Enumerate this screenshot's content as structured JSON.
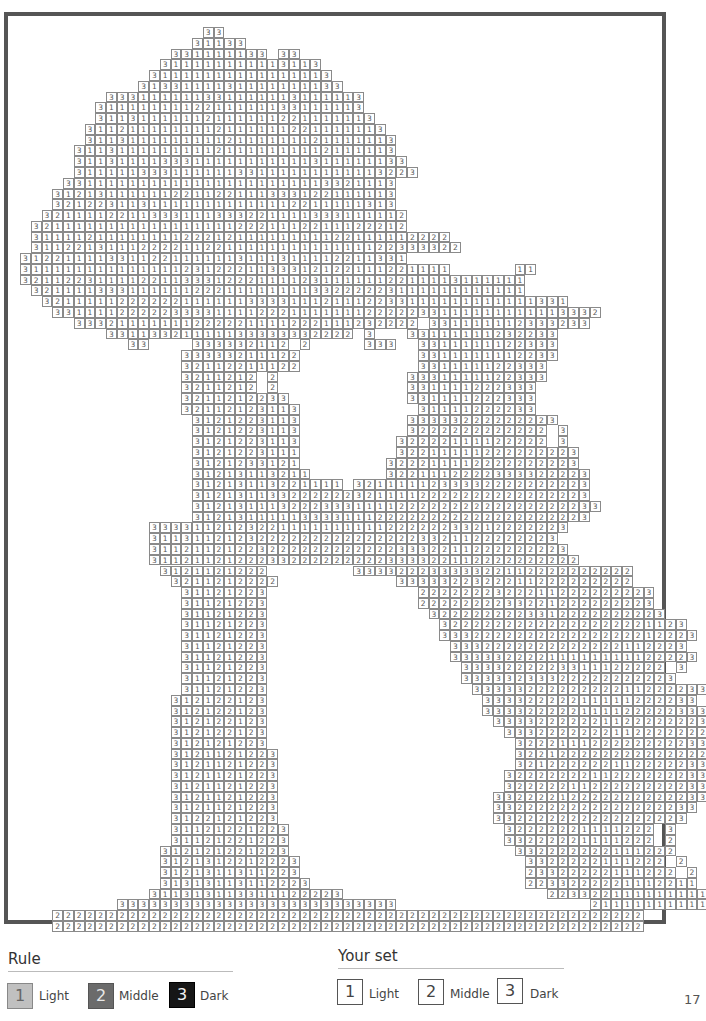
{
  "page_number": "17",
  "puzzle": {
    "cell_width": 10.75,
    "cell_height": 10.77,
    "origin_x": 20,
    "origin_y": 27,
    "rows": [
      {
        "start": 17,
        "cells": "33"
      },
      {
        "start": 16,
        "cells": "31133"
      },
      {
        "start": 14,
        "cells": "331111133 33"
      },
      {
        "start": 13,
        "cells": "311111111113113"
      },
      {
        "start": 12,
        "cells": "31111111111111113"
      },
      {
        "start": 11,
        "cells": "3133111131111111133"
      },
      {
        "start": 8,
        "cells": "333111111331111113111113"
      },
      {
        "start": 7,
        "cells": "3111111112211111133111113"
      },
      {
        "start": 7,
        "cells": "31131111112111111221111113"
      },
      {
        "start": 6,
        "cells": "3112111111112111111221111113"
      },
      {
        "start": 6,
        "cells": "31131111111112111111121111113"
      },
      {
        "start": 5,
        "cells": "311311111111121111111112111113"
      },
      {
        "start": 5,
        "cells": "3113111133311111111111311111133"
      },
      {
        "start": 5,
        "cells": "31111133311111133111111111113223"
      },
      {
        "start": 4,
        "cells": "3311111111111111111111113321113"
      },
      {
        "start": 3,
        "cells": "31213111111221122111333122111113"
      },
      {
        "start": 3,
        "cells": "32122311311111111111112211111313"
      },
      {
        "start": 2,
        "cells": "3211112211333111333221111333111112"
      },
      {
        "start": 1,
        "cells": "32111111111111111112221112211122212"
      },
      {
        "start": 1,
        "cells": "311112111111112221211111111122111112222"
      },
      {
        "start": 1,
        "cells": "3112213111222211221111111111111122333322"
      },
      {
        "start": 0,
        "cells": "312211113311221111113111311112211331"
      },
      {
        "start": 0,
        "cells": "3111111111111112312221133312122111221111      11"
      },
      {
        "start": 0,
        "cells": "32112231111221133312221111231111112211113111111"
      },
      {
        "start": 1,
        "cells": "3211113331111112221111111133222223111111111111"
      },
      {
        "start": 2,
        "cells": "3211111222222111111333311121112233111111111111331"
      },
      {
        "start": 3,
        "cells": "331111222223333111122211111112222233111111111113332"
      },
      {
        "start": 5,
        "cells": "33321111111222221111222111232222 331111112333233"
      },
      {
        "start": 8,
        "cells": "33113321111133333332222 3   33111111232233"
      },
      {
        "start": 10,
        "cells": "33    333332112 2     333  3311111122333"
      },
      {
        "start": 15,
        "cells": "33333211122           3311111112233"
      },
      {
        "start": 15,
        "cells": "32112211122           331111122333"
      },
      {
        "start": 15,
        "cells": "3211212 2            3331111122333"
      },
      {
        "start": 15,
        "cells": "3211212 2            331111222333"
      },
      {
        "start": 15,
        "cells": "3211212233           331111222333"
      },
      {
        "start": 15,
        "cells": "32112123113           31111222233"
      },
      {
        "start": 16,
        "cells": "3121223113          33333222222223"
      },
      {
        "start": 16,
        "cells": "3121223113          3222222222222 3"
      },
      {
        "start": 16,
        "cells": "3121223113         32222111122222 3"
      },
      {
        "start": 16,
        "cells": "3121223111         32211111222222223"
      },
      {
        "start": 16,
        "cells": "3121233121        322211112222222223"
      },
      {
        "start": 16,
        "cells": "31213113211       3221112222333322223"
      },
      {
        "start": 16,
        "cells": "31213113221111 3211111233332222222223"
      },
      {
        "start": 16,
        "cells": "3121311332222223211112222222222222223"
      },
      {
        "start": 16,
        "cells": "31213111322233311112222222222222222233"
      },
      {
        "start": 16,
        "cells": "3121311111333311122222222222222222223"
      },
      {
        "start": 12,
        "cells": "333311212322111111111122222233212222223"
      },
      {
        "start": 12,
        "cells": "31131121232222222222222223321122222223"
      },
      {
        "start": 12,
        "cells": "311211212232222222222223332211222222223"
      },
      {
        "start": 12,
        "cells": "3112112122233222222222333322112222222222"
      },
      {
        "start": 13,
        "cells": "3121121222        33332223333322112222222222"
      },
      {
        "start": 14,
        "cells": "3211212222           3333322322211222222222"
      },
      {
        "start": 15,
        "cells": "31121223              2222222322211222222223"
      },
      {
        "start": 15,
        "cells": "31121223              2222222233221222222223"
      },
      {
        "start": 15,
        "cells": "31121223               3222222223312222222223"
      },
      {
        "start": 15,
        "cells": "31121223                32222222222222222221123"
      },
      {
        "start": 15,
        "cells": "31121223                333222222222222222212223"
      },
      {
        "start": 15,
        "cells": "31121223                 3332222222222222112223"
      },
      {
        "start": 15,
        "cells": "31121223                 33333222211111111122223"
      },
      {
        "start": 15,
        "cells": "31121223                  3333222223311122222 3"
      },
      {
        "start": 15,
        "cells": "31121223                  33333233322222222223"
      },
      {
        "start": 15,
        "cells": "31121223                   3333322222222211222233"
      },
      {
        "start": 14,
        "cells": "312122123                    33332222211111222233"
      },
      {
        "start": 14,
        "cells": "312122123                    333322222111122222333"
      },
      {
        "start": 14,
        "cells": "312122123                     3333222222112222222333"
      },
      {
        "start": 14,
        "cells": "312122123                      3332222222112222222333"
      },
      {
        "start": 14,
        "cells": "312121223                       322211122222222233"
      },
      {
        "start": 14,
        "cells": "3121121223                      32212222222222222233"
      },
      {
        "start": 14,
        "cells": "3121121223                      3212222221122222333"
      },
      {
        "start": 14,
        "cells": "3121121223                     32222222112222222333"
      },
      {
        "start": 14,
        "cells": "3121121223                     3222221122222222233"
      },
      {
        "start": 14,
        "cells": "3121121223                    332222122222222222333"
      },
      {
        "start": 14,
        "cells": "3121121223                    3322222222222222233"
      },
      {
        "start": 14,
        "cells": "3122121223                    332222222222222223"
      },
      {
        "start": 14,
        "cells": "31121221223                    32222221111222 3"
      },
      {
        "start": 14,
        "cells": "31121221223                    33222221111222 2"
      },
      {
        "start": 13,
        "cells": "312121221223                     332222222111222"
      },
      {
        "start": 13,
        "cells": "3121312212223                     3322222111222 2"
      },
      {
        "start": 13,
        "cells": "3121311311223                     23322222111222 2"
      },
      {
        "start": 13,
        "cells": "31313113112223                    2233222221112211"
      },
      {
        "start": 12,
        "cells": "311313113311122223                   223322111111111"
      },
      {
        "start": 9,
        "cells": "33333333333333333333333333                  21111111111133"
      },
      {
        "start": 3,
        "cells": "2222222222222222222222222222222222222222222222222222222"
      },
      {
        "start": 3,
        "cells": "2222222222222222222222222222222222222222222222222222222"
      }
    ]
  },
  "legend": {
    "rule": {
      "title": "Rule",
      "items": [
        {
          "value": "1",
          "label": "Light"
        },
        {
          "value": "2",
          "label": "Middle"
        },
        {
          "value": "3",
          "label": "Dark"
        }
      ]
    },
    "your_set": {
      "title": "Your set",
      "items": [
        {
          "value": "1",
          "label": "Light"
        },
        {
          "value": "2",
          "label": "Middle"
        },
        {
          "value": "3",
          "label": "Dark"
        }
      ]
    }
  },
  "colors": {
    "light": "#c0c0c0",
    "middle": "#6b6b6b",
    "dark": "#161616",
    "frame": "#555555"
  }
}
